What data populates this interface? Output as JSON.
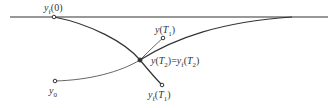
{
  "diagram": {
    "colors": {
      "line": "#333333",
      "thin": "#555555",
      "background": "#ffffff"
    },
    "labels": {
      "yf0": "y_f(0)",
      "yT1": "y(T_1)",
      "intersection": "y(T_2)=y_f(T_2)",
      "y0": "y_0",
      "yfT1": "y_f(T_1)"
    },
    "points": [
      {
        "name": "yf0",
        "x": 54,
        "y": 17
      },
      {
        "name": "yT1",
        "x": 163,
        "y": 38
      },
      {
        "name": "intersection",
        "x": 140,
        "y": 60
      },
      {
        "name": "y0",
        "x": 55,
        "y": 81
      },
      {
        "name": "yfT1",
        "x": 162,
        "y": 85
      }
    ]
  }
}
